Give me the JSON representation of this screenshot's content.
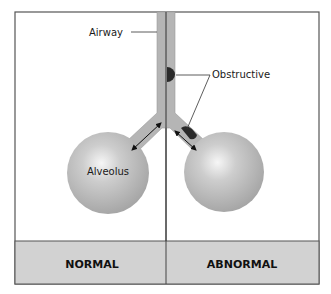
{
  "diagram": {
    "labels": {
      "airway": "Airway",
      "obstructive": "Obstructive",
      "alveolus": "Alveolus"
    },
    "panels": [
      {
        "label": "NORMAL"
      },
      {
        "label": "ABNORMAL"
      }
    ],
    "colors": {
      "frame": "#555555",
      "tube": "#b5b5b5",
      "sphere_light": "#f4f4f4",
      "sphere_dark": "#a8a8a8",
      "obstruction": "#2a2a2a",
      "footer_band": "#d2d2d2"
    }
  }
}
